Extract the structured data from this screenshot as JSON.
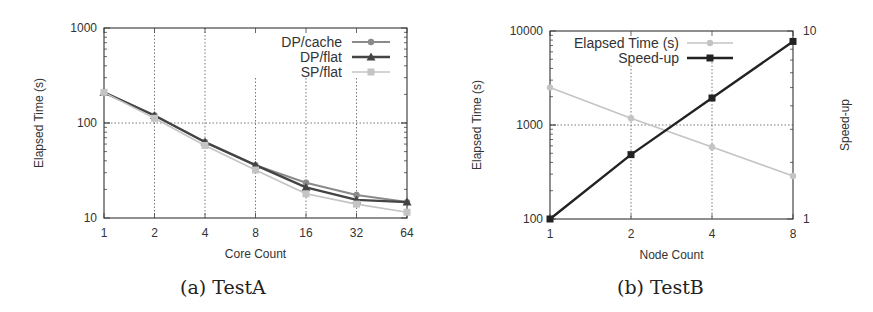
{
  "chart_data": [
    {
      "type": "line",
      "caption": "(a) TestA",
      "title": "",
      "xlabel": "Core Count",
      "ylabel": "Elapsed Time (s)",
      "x": [
        1,
        2,
        4,
        8,
        16,
        32,
        64
      ],
      "x_tick_labels": [
        "1",
        "2",
        "4",
        "8",
        "16",
        "32",
        "64"
      ],
      "x_scale": "log2",
      "y_scale": "log",
      "ylim": [
        10,
        1000
      ],
      "y_tick_labels": [
        "10",
        "100",
        "1000"
      ],
      "grid": true,
      "legend_position": "top-right",
      "series": [
        {
          "name": "DP/cache",
          "color": "#8a8a8a",
          "marker": "circle",
          "values": [
            210,
            120,
            63,
            36,
            23.5,
            17.5,
            14.7
          ]
        },
        {
          "name": "DP/flat",
          "color": "#444444",
          "marker": "triangle",
          "values": [
            210,
            120,
            63,
            36,
            21,
            15.5,
            14.7
          ]
        },
        {
          "name": "SP/flat",
          "color": "#c4c4c4",
          "marker": "square",
          "values": [
            210,
            112,
            58,
            32,
            18,
            14,
            11.5
          ]
        }
      ]
    },
    {
      "type": "line",
      "caption": "(b) TestB",
      "title": "",
      "xlabel": "Node Count",
      "ylabel": "Elapsed Time (s)",
      "y2label": "Speed-up",
      "x": [
        1,
        2,
        4,
        8
      ],
      "x_tick_labels": [
        "1",
        "2",
        "4",
        "8"
      ],
      "x_scale": "log2",
      "y_scale": "log",
      "ylim": [
        100,
        10000
      ],
      "y_tick_labels": [
        "100",
        "1000",
        "10000"
      ],
      "y2_scale": "log",
      "y2lim": [
        1,
        10
      ],
      "y2_tick_labels": [
        "1",
        "10"
      ],
      "grid": true,
      "legend_position": "top-center",
      "series": [
        {
          "name": "Elapsed Time (s)",
          "axis": "left",
          "color": "#c4c4c4",
          "marker": "circle",
          "values": [
            2500,
            1180,
            585,
            287
          ]
        },
        {
          "name": "Speed-up",
          "axis": "right",
          "color": "#222222",
          "marker": "square",
          "values": [
            1.0,
            2.2,
            4.4,
            8.8
          ]
        }
      ]
    }
  ]
}
